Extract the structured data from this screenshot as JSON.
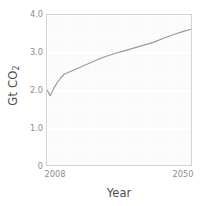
{
  "chart_data": {
    "type": "line",
    "title": "",
    "xlabel": "Year",
    "ylabel": "Gt CO",
    "ylabel_sub": "2",
    "ylabel_full": "Gt CO2",
    "xlim": [
      2008,
      2050
    ],
    "ylim": [
      0,
      4.0
    ],
    "grid": true,
    "legend": "none",
    "line_color": "#9a9a9a",
    "panel_color": "#fbfbfb",
    "grid_color": "#ffffff",
    "axis_text_color": "#8c8c8c",
    "axis_title_color": "#4d4d4d",
    "x_ticks": [
      {
        "value": 2008,
        "label": "2008"
      },
      {
        "value": 2050,
        "label": "2050"
      }
    ],
    "x_minor_gridlines": [
      2014,
      2021,
      2029,
      2036,
      2043
    ],
    "y_ticks": [
      {
        "value": 4.0,
        "label": "4.0"
      },
      {
        "value": 3.0,
        "label": "3.0"
      },
      {
        "value": 2.0,
        "label": "2.0"
      },
      {
        "value": 1.0,
        "label": "1.0"
      },
      {
        "value": 0.0,
        "label": "0"
      }
    ],
    "y_minor_gridlines": [
      0.5,
      1.5,
      2.5,
      3.5
    ],
    "series": [
      {
        "name": "CO2 emissions",
        "x": [
          2008,
          2009,
          2010,
          2011,
          2012,
          2013,
          2014,
          2015,
          2016,
          2017,
          2018,
          2019,
          2020,
          2022,
          2024,
          2026,
          2028,
          2030,
          2033,
          2036,
          2039,
          2042,
          2045,
          2048,
          2050
        ],
        "y": [
          2.0,
          1.85,
          2.05,
          2.2,
          2.32,
          2.42,
          2.46,
          2.5,
          2.54,
          2.58,
          2.62,
          2.66,
          2.7,
          2.78,
          2.86,
          2.92,
          2.98,
          3.03,
          3.11,
          3.19,
          3.27,
          3.38,
          3.48,
          3.57,
          3.62
        ]
      }
    ]
  }
}
